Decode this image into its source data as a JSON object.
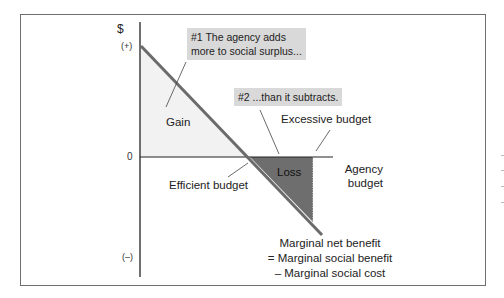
{
  "diagram": {
    "y_axis": {
      "symbol": "$",
      "positive_label": "(+)",
      "zero_label": "0",
      "negative_label": "(–)"
    },
    "x_axis": {
      "label_line1": "Agency",
      "label_line2": "budget"
    },
    "curve": {
      "name_line1": "Marginal net benefit",
      "name_line2": "= Marginal social benefit",
      "name_line3": "– Marginal social cost"
    },
    "regions": {
      "gain": "Gain",
      "loss": "Loss"
    },
    "markers": {
      "efficient": "Efficient budget",
      "excessive": "Excessive budget"
    },
    "callouts": [
      {
        "line1": "#1 The agency adds",
        "line2": "more to social surplus..."
      },
      {
        "line1": "#2 ...than it subtracts."
      }
    ],
    "colors": {
      "curve": "#6b6b6b",
      "loss_fill": "#6e6e6e",
      "gain_fill": "#f3f3f3",
      "callout_bg": "#d9d9d9",
      "axis": "#222222"
    }
  }
}
